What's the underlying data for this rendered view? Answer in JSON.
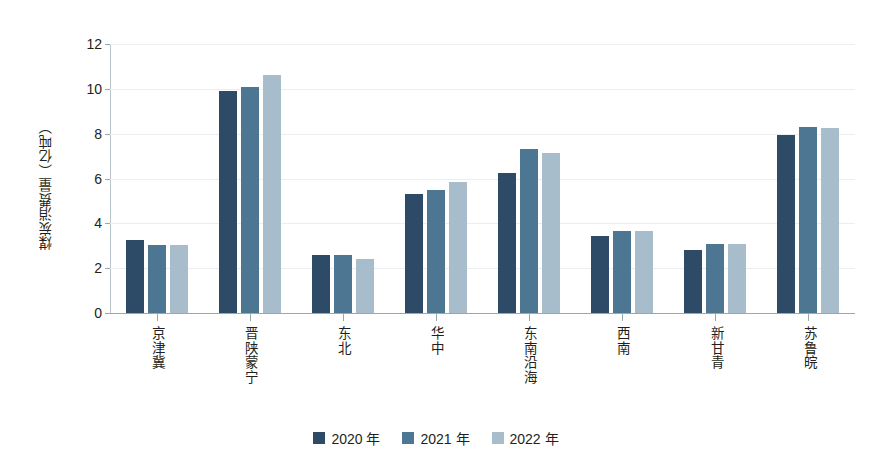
{
  "chart_data": {
    "type": "bar",
    "title": "",
    "subtitle": "",
    "xlabel": "",
    "ylabel": "煤炭消费量（亿吨）",
    "ylim": [
      0,
      12
    ],
    "ytick_values": [
      0,
      2,
      4,
      6,
      8,
      10,
      12
    ],
    "ytick_labels": [
      "0",
      "2",
      "4",
      "6",
      "8",
      "10",
      "12"
    ],
    "grid": true,
    "grid_axis": "y",
    "legend_position": "bottom",
    "categories": [
      "京津冀",
      "晋陕蒙宁",
      "东北",
      "华中",
      "东南沿海",
      "西南",
      "新甘青",
      "苏鲁皖"
    ],
    "series": [
      {
        "name": "2020 年",
        "color": "#2d4a66",
        "values": [
          3.25,
          9.9,
          2.6,
          5.3,
          6.25,
          3.45,
          2.8,
          7.95
        ]
      },
      {
        "name": "2021 年",
        "color": "#4c7691",
        "values": [
          3.05,
          10.1,
          2.6,
          5.5,
          7.3,
          3.65,
          3.1,
          8.3
        ]
      },
      {
        "name": "2022 年",
        "color": "#a8bdcc",
        "values": [
          3.05,
          10.6,
          2.4,
          5.85,
          7.15,
          3.65,
          3.1,
          8.25
        ]
      }
    ],
    "colors": {
      "series_2020": "#2d4a66",
      "series_2021": "#4c7691",
      "series_2022": "#a8bdcc",
      "axis": "#9aa7ae",
      "gridline": "#e9eef1",
      "text": "#231f20",
      "background": "#ffffff"
    }
  },
  "legend": {
    "items": [
      {
        "label": "2020 年",
        "color": "#2d4a66"
      },
      {
        "label": "2021 年",
        "color": "#4c7691"
      },
      {
        "label": "2022 年",
        "color": "#a8bdcc"
      }
    ]
  }
}
